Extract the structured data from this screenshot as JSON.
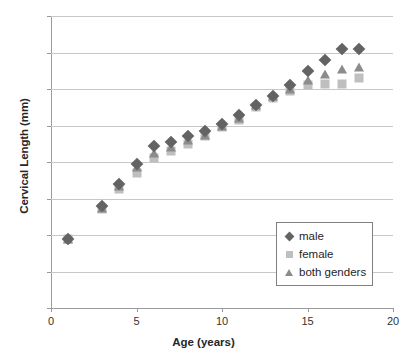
{
  "chart_data": {
    "type": "scatter",
    "title": "",
    "xlabel": "Age (years)",
    "ylabel": "Cervical Length (mm)",
    "xlim": [
      0,
      20
    ],
    "ylim": [
      0,
      80
    ],
    "xticks": [
      0,
      5,
      10,
      15,
      20
    ],
    "yticks": [
      0,
      10,
      20,
      30,
      40,
      50,
      60,
      70,
      80
    ],
    "grid": true,
    "legend_position": "inside-bottom-right",
    "x": [
      1,
      3,
      4,
      5,
      6,
      7,
      8,
      9,
      10,
      11,
      12,
      13,
      14,
      15,
      16,
      17,
      18
    ],
    "series": [
      {
        "name": "male",
        "marker": "diamond",
        "color": "#636363",
        "values": [
          19,
          28,
          34,
          39.5,
          44.5,
          45.5,
          47,
          48.5,
          50.5,
          53,
          55.5,
          58,
          61,
          65,
          68,
          71,
          71
        ]
      },
      {
        "name": "female",
        "marker": "square",
        "color": "#bfbfbf",
        "values": [
          19,
          27,
          32.5,
          37,
          41,
          43,
          45,
          47,
          49.5,
          51.5,
          55,
          57.5,
          59.5,
          61,
          61.5,
          61.5,
          63
        ]
      },
      {
        "name": "both genders",
        "marker": "triangle",
        "color": "#8c8c8c",
        "values": [
          19,
          27.5,
          33.5,
          38.5,
          42.5,
          44,
          46,
          47.5,
          50,
          52,
          55.5,
          58,
          60,
          62.5,
          64,
          65.5,
          66
        ]
      }
    ]
  },
  "legend": {
    "items": [
      {
        "label": "male",
        "marker": "diamond-icon"
      },
      {
        "label": "female",
        "marker": "square-icon"
      },
      {
        "label": "both genders",
        "marker": "triangle-icon"
      }
    ]
  }
}
